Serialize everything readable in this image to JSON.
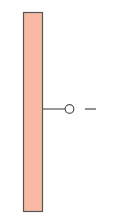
{
  "diagram": {
    "electrode": {
      "fill": "#f9b9a5",
      "stroke": "#555555"
    },
    "terminal": {
      "stroke": "#555555"
    },
    "polarity_label": "−"
  }
}
